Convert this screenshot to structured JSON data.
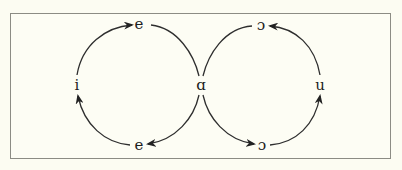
{
  "diagram": {
    "type": "vowel-shift-figure-eight",
    "nodes": {
      "top_left": "e",
      "top_right": "ɔ",
      "left": "i",
      "center": "ɑ",
      "right": "u",
      "bottom_left": "e",
      "bottom_right": "ɔ"
    },
    "edges": [
      {
        "from": "left",
        "to": "top_left",
        "arrow": true
      },
      {
        "from": "top_left",
        "to": "center",
        "arrow": false
      },
      {
        "from": "center",
        "to": "bottom_left",
        "arrow": true
      },
      {
        "from": "bottom_left",
        "to": "left",
        "arrow": true
      },
      {
        "from": "center",
        "to": "bottom_right",
        "arrow": true
      },
      {
        "from": "bottom_right",
        "to": "right",
        "arrow": true
      },
      {
        "from": "right",
        "to": "top_right",
        "arrow": true
      },
      {
        "from": "top_right",
        "to": "center",
        "arrow": false
      }
    ],
    "colors": {
      "background": "#fcfcf2",
      "frame": "#8c8c84",
      "stroke": "#2a2a2a"
    }
  }
}
